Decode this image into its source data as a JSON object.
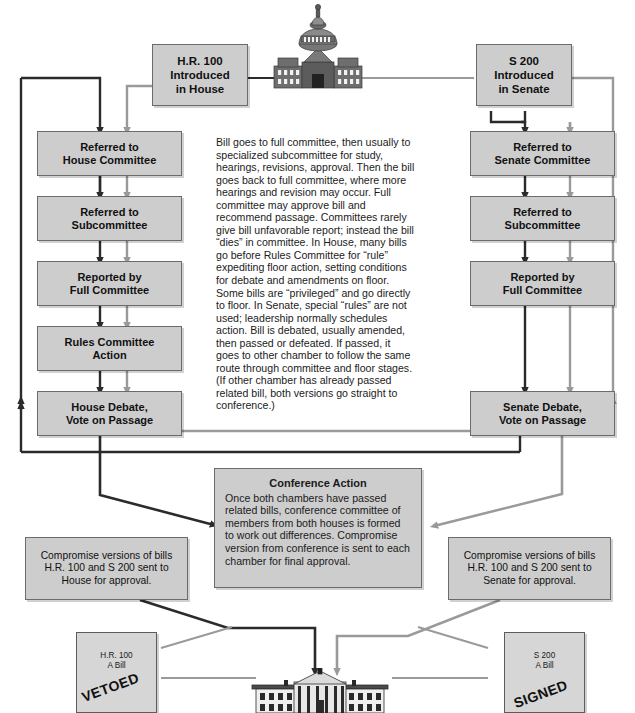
{
  "diagram": {
    "colors": {
      "box_fill": "#cdcdcd",
      "box_border": "#6b6b6b",
      "house_flow": "#2b2b2b",
      "senate_flow": "#9a9a9a",
      "page_background": "#ffffff"
    },
    "intro": {
      "house": "H.R. 100\nIntroduced\nin House",
      "house_line1": "H.R. 100",
      "house_line2": "Introduced",
      "house_line3": "in House",
      "senate_line1": "S 200",
      "senate_line2": "Introduced",
      "senate_line3": "in Senate"
    },
    "house_steps": [
      {
        "line1": "Referred to",
        "line2": "House Committee"
      },
      {
        "line1": "Referred to",
        "line2": "Subcommittee"
      },
      {
        "line1": "Reported by",
        "line2": "Full Committee"
      },
      {
        "line1": "Rules Committee",
        "line2": "Action"
      },
      {
        "line1": "House Debate,",
        "line2": "Vote on Passage"
      }
    ],
    "senate_steps": [
      {
        "line1": "Referred to",
        "line2": "Senate Committee"
      },
      {
        "line1": "Referred to",
        "line2": "Subcommittee"
      },
      {
        "line1": "Reported by",
        "line2": "Full Committee"
      },
      {
        "line1": "Senate Debate,",
        "line2": "Vote on Passage"
      }
    ],
    "committee_note": "Bill goes to full committee, then usually to specialized subcommittee for study, hearings, revisions, approval. Then the bill goes back to full committee, where more hearings and revision may occur. Full committee may approve bill and recommend passage. Committees rarely give bill unfavorable report; instead the bill “dies” in committee. In House, many bills go before Rules Committee for “rule” expediting floor action, setting conditions for debate and amendments on floor. Some bills are “privileged” and go directly to floor. In Senate, special “rules” are not used; leadership normally schedules action. Bill is debated, usually amended, then passed or defeated. If passed, it goes to other chamber to follow the same route through committee and floor stages. (If other chamber has already passed related bill, both versions go straight to conference.)",
    "conference": {
      "heading": "Conference Action",
      "body": "Once both chambers have passed related bills, conference committee of members from both houses is formed to work out differences. Compromise version from conference is sent to each chamber for final approval."
    },
    "compromise_house": "Compromise versions of bills H.R. 100 and S 200 sent to House for approval.",
    "compromise_senate": "Compromise versions of bills H.R. 100 and S 200 sent to Senate for approval.",
    "vetoed_bill": {
      "line1": "H.R. 100",
      "line2": "A Bill",
      "stamp": "VETOED"
    },
    "signed_bill": {
      "line1": "S 200",
      "line2": "A Bill",
      "stamp": "SIGNED"
    },
    "landmarks": {
      "capitol": "us-capitol-building",
      "white_house": "white-house-building"
    }
  }
}
